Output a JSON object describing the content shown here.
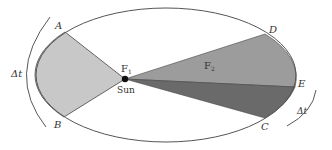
{
  "diagram": {
    "labels": {
      "A": "A",
      "B": "B",
      "C": "C",
      "D": "D",
      "E": "E",
      "F1": "F",
      "F1_sub": "1",
      "F2": "F",
      "F2_sub": "2",
      "sun": "Sun",
      "dt_left": "Δt",
      "dt_right": "Δt"
    },
    "colors": {
      "orbit": "#555555",
      "sector_AB": "#c8c8c8",
      "sector_DE": "#9a9a9a",
      "sector_EC": "#6a6a6a",
      "sun": "#111111"
    }
  }
}
